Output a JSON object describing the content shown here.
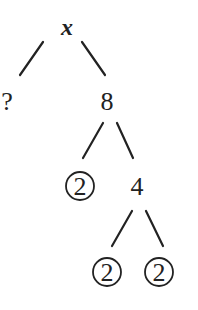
{
  "diagram": {
    "type": "factor-tree",
    "root": {
      "label": "x",
      "style": "bold-italic"
    },
    "nodes": [
      {
        "id": "root",
        "label": "x",
        "circled": false
      },
      {
        "id": "unknown",
        "label": "?",
        "circled": false,
        "parent": "root"
      },
      {
        "id": "n8",
        "label": "8",
        "circled": false,
        "parent": "root"
      },
      {
        "id": "p2a",
        "label": "2",
        "circled": true,
        "parent": "n8"
      },
      {
        "id": "n4",
        "label": "4",
        "circled": false,
        "parent": "n8"
      },
      {
        "id": "p2b",
        "label": "2",
        "circled": true,
        "parent": "n4"
      },
      {
        "id": "p2c",
        "label": "2",
        "circled": true,
        "parent": "n4"
      }
    ],
    "colors": {
      "ink": "#222222",
      "background": "#ffffff"
    }
  }
}
